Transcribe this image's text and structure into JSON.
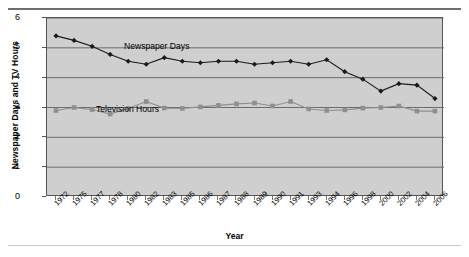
{
  "chart_data": {
    "type": "line",
    "title": "",
    "xlabel": "Year",
    "ylabel": "Newspaper Days and TV Hours",
    "ylim": [
      0,
      6
    ],
    "yticks": [
      0,
      1,
      2,
      3,
      4,
      5,
      6
    ],
    "grid": true,
    "legend_position": "inline-annotations",
    "categories": [
      "1972",
      "1975",
      "1977",
      "1978",
      "1980",
      "1982",
      "1983",
      "1985",
      "1986",
      "1987",
      "1988",
      "1989",
      "1990",
      "1991",
      "1993",
      "1994",
      "1996",
      "1998",
      "2000",
      "2002",
      "2004",
      "2006"
    ],
    "series": [
      {
        "name": "Newspaper Days",
        "color": "#1a1a1a",
        "marker": "diamond",
        "values": [
          5.4,
          5.25,
          5.05,
          4.78,
          4.55,
          4.45,
          4.67,
          4.55,
          4.5,
          4.55,
          4.55,
          4.45,
          4.5,
          4.55,
          4.45,
          4.6,
          4.2,
          3.95,
          3.55,
          3.8,
          3.75,
          3.3
        ]
      },
      {
        "name": "Television Hours",
        "color": "#8f8f8f",
        "marker": "square",
        "values": [
          2.9,
          3.0,
          2.93,
          2.78,
          2.97,
          3.2,
          2.98,
          2.97,
          3.02,
          3.07,
          3.12,
          3.15,
          3.05,
          3.2,
          2.95,
          2.9,
          2.92,
          2.98,
          3.0,
          3.05,
          2.88,
          2.88
        ]
      }
    ]
  },
  "annotations": {
    "newspaper_label": "Newspaper Days",
    "television_label": "Television Hours"
  }
}
